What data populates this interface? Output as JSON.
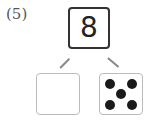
{
  "problem": {
    "label": "(5)",
    "total": "8",
    "left_part": "",
    "right_part_dots": 5
  }
}
